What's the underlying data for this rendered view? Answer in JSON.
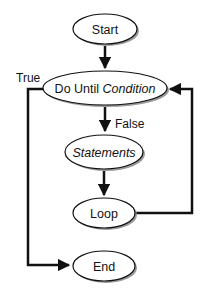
{
  "diagram": {
    "type": "flowchart",
    "colors": {
      "stroke": "#111111",
      "fill": "#ffffff",
      "shadow": "#9a9a9a"
    },
    "nodes": [
      {
        "id": "start",
        "label": "Start",
        "shape": "ellipse"
      },
      {
        "id": "condition",
        "label_prefix": "Do Until ",
        "label_italic": "Condition",
        "shape": "ellipse"
      },
      {
        "id": "statements",
        "label": "Statements",
        "italic": true,
        "shape": "ellipse"
      },
      {
        "id": "loop",
        "label": "Loop",
        "shape": "ellipse"
      },
      {
        "id": "end",
        "label": "End",
        "shape": "ellipse"
      }
    ],
    "edges": [
      {
        "from": "start",
        "to": "condition",
        "label": ""
      },
      {
        "from": "condition",
        "to": "statements",
        "label": "False"
      },
      {
        "from": "statements",
        "to": "loop",
        "label": ""
      },
      {
        "from": "loop",
        "to": "condition",
        "label": ""
      },
      {
        "from": "condition",
        "to": "end",
        "label": "True"
      }
    ],
    "labels": {
      "true": "True",
      "false": "False"
    }
  }
}
